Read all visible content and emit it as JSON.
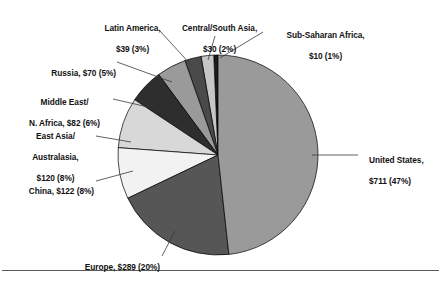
{
  "chart_data": {
    "type": "pie",
    "title": "",
    "subtitle": "",
    "xlabel": "",
    "ylabel": "",
    "units": "billions of dollars",
    "legend_position": "none",
    "grid": false,
    "labels_outside": true,
    "total_value": 1473,
    "categories": [
      "United States",
      "Europe",
      "China",
      "East Asia/Australasia",
      "Middle East/N. Africa",
      "Russia",
      "Latin America",
      "Central/South Asia",
      "Sub-Saharan Africa"
    ],
    "values": [
      711,
      289,
      122,
      120,
      82,
      70,
      39,
      30,
      10
    ],
    "percents": [
      47,
      20,
      8,
      8,
      6,
      5,
      3,
      2,
      1
    ],
    "slices": [
      {
        "name": "united-states",
        "label_line1": "United States,",
        "label_line2": "$711 (47%)",
        "value": 711,
        "percent": 47,
        "color": "#9a9a9a"
      },
      {
        "name": "europe",
        "label_line1": "Europe, $289 (20%)",
        "label_line2": "",
        "value": 289,
        "percent": 20,
        "color": "#565656"
      },
      {
        "name": "china",
        "label_line1": "China, $122 (8%)",
        "label_line2": "",
        "value": 122,
        "percent": 8,
        "color": "#f2f2f2"
      },
      {
        "name": "east-asia-australasia",
        "label_line1": "East Asia/",
        "label_line2": "Australasia,",
        "label_line3": "$120 (8%)",
        "value": 120,
        "percent": 8,
        "color": "#d8d8d8"
      },
      {
        "name": "middle-east-n-africa",
        "label_line1": "Middle East/",
        "label_line2": "N. Africa, $82 (6%)",
        "value": 82,
        "percent": 6,
        "color": "#2e2e2e"
      },
      {
        "name": "russia",
        "label_line1": "Russia, $70 (5%)",
        "label_line2": "",
        "value": 70,
        "percent": 5,
        "color": "#9a9a9a"
      },
      {
        "name": "latin-america",
        "label_line1": "Latin America,",
        "label_line2": "$39 (3%)",
        "value": 39,
        "percent": 3,
        "color": "#4a4a4a"
      },
      {
        "name": "central-south-asia",
        "label_line1": "Central/South Asia,",
        "label_line2": "$30 (2%)",
        "value": 30,
        "percent": 2,
        "color": "#c6c6c6"
      },
      {
        "name": "sub-saharan-africa",
        "label_line1": "Sub-Saharan Africa,",
        "label_line2": "$10 (1%)",
        "value": 10,
        "percent": 1,
        "color": "#1c1c1c"
      }
    ]
  }
}
